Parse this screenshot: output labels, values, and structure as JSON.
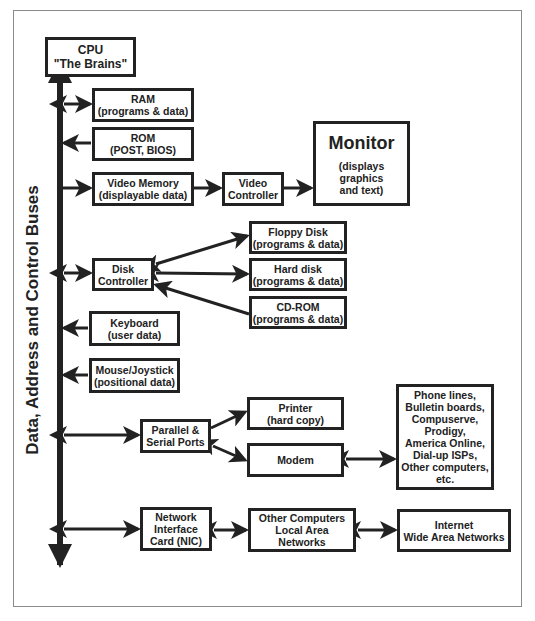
{
  "diagram": {
    "bus_label": "Data, Address and Control Buses",
    "colors": {
      "stroke": "#222222",
      "frame": "#8a8a8a",
      "background": "#ffffff"
    },
    "nodes": {
      "cpu": [
        "CPU",
        "\"The Brains\""
      ],
      "ram": [
        "RAM",
        "(programs & data)"
      ],
      "rom": [
        "ROM",
        "(POST, BIOS)"
      ],
      "video_memory": [
        "Video Memory",
        "(displayable data)"
      ],
      "video_controller": [
        "Video",
        "Controller"
      ],
      "monitor": {
        "title": "Monitor",
        "lines": [
          "(displays graphics",
          "and text)"
        ]
      },
      "disk_controller": [
        "Disk",
        "Controller"
      ],
      "floppy": [
        "Floppy Disk",
        "(programs & data)"
      ],
      "hard_disk": [
        "Hard disk",
        "(programs & data)"
      ],
      "cdrom": [
        "CD-ROM",
        "(programs & data)"
      ],
      "keyboard": [
        "Keyboard",
        "(user data)"
      ],
      "mouse": [
        "Mouse/Joystick",
        "(positional data)"
      ],
      "ports": [
        "Parallel &",
        "Serial Ports"
      ],
      "printer": [
        "Printer",
        "(hard copy)"
      ],
      "modem": [
        "Modem"
      ],
      "phone": [
        "Phone lines,",
        "Bulletin boards,",
        "Compuserve,",
        "Prodigy,",
        "America Online,",
        "Dial-up ISPs,",
        "Other computers,",
        "etc."
      ],
      "nic": [
        "Network",
        "Interface",
        "Card (NIC)"
      ],
      "lan": [
        "Other Computers",
        "Local Area Networks"
      ],
      "wan": [
        "Internet",
        "Wide Area Networks"
      ]
    },
    "edges": [
      {
        "from": "bus",
        "to": "cpu",
        "type": "one-way"
      },
      {
        "from": "bus",
        "to": "ram",
        "type": "two-way"
      },
      {
        "from": "rom",
        "to": "bus",
        "type": "one-way"
      },
      {
        "from": "bus",
        "to": "video_memory",
        "type": "one-way"
      },
      {
        "from": "video_memory",
        "to": "video_controller",
        "type": "one-way"
      },
      {
        "from": "video_controller",
        "to": "monitor",
        "type": "one-way"
      },
      {
        "from": "bus",
        "to": "disk_controller",
        "type": "two-way"
      },
      {
        "from": "disk_controller",
        "to": "floppy",
        "type": "two-way"
      },
      {
        "from": "disk_controller",
        "to": "hard_disk",
        "type": "two-way"
      },
      {
        "from": "cdrom",
        "to": "disk_controller",
        "type": "one-way"
      },
      {
        "from": "keyboard",
        "to": "bus",
        "type": "one-way"
      },
      {
        "from": "mouse",
        "to": "bus",
        "type": "one-way"
      },
      {
        "from": "bus",
        "to": "ports",
        "type": "two-way"
      },
      {
        "from": "ports",
        "to": "printer",
        "type": "one-way"
      },
      {
        "from": "ports",
        "to": "modem",
        "type": "two-way"
      },
      {
        "from": "modem",
        "to": "phone",
        "type": "two-way"
      },
      {
        "from": "bus",
        "to": "nic",
        "type": "two-way"
      },
      {
        "from": "nic",
        "to": "lan",
        "type": "two-way"
      },
      {
        "from": "lan",
        "to": "wan",
        "type": "two-way"
      }
    ]
  }
}
